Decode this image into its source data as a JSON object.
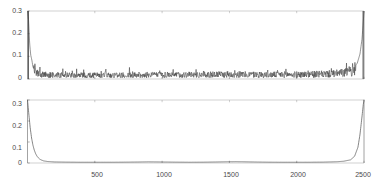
{
  "chart_data": [
    {
      "id": "top-panel",
      "type": "line",
      "title": "",
      "xlabel": "",
      "ylabel": "",
      "xlim": [
        0,
        2500
      ],
      "ylim": [
        0,
        0.3
      ],
      "grid": false,
      "legend": "none",
      "x_tick_labels": [],
      "x_ticks": [
        500,
        1000,
        1500,
        2000,
        2500
      ],
      "y_ticks": [
        0,
        0.1,
        0.2,
        0.3
      ],
      "y_tick_labels": [
        "0",
        "0.1",
        "0.2",
        "0.3"
      ],
      "description": "Noisy signal: tall narrow spike to 0.3 at left edge, dense low-amplitude noise floor around 0.01-0.04 across the middle, tall narrow spike to 0.3 at right edge",
      "series": [
        {
          "name": "noisy",
          "color": "#3c3c3c",
          "x": [
            0,
            8,
            16,
            24,
            32,
            40,
            48,
            56,
            64,
            72,
            80,
            100,
            150,
            200,
            300,
            400,
            500,
            600,
            700,
            800,
            900,
            1000,
            1100,
            1200,
            1250,
            1300,
            1400,
            1500,
            1600,
            1700,
            1800,
            1900,
            2000,
            2100,
            2200,
            2300,
            2380,
            2420,
            2450,
            2470,
            2485,
            2495,
            2500
          ],
          "values": [
            0.3,
            0.26,
            0.155,
            0.105,
            0.085,
            0.055,
            0.042,
            0.035,
            0.03,
            0.026,
            0.024,
            0.022,
            0.02,
            0.019,
            0.018,
            0.018,
            0.018,
            0.019,
            0.018,
            0.019,
            0.02,
            0.019,
            0.02,
            0.021,
            0.02,
            0.02,
            0.021,
            0.022,
            0.021,
            0.021,
            0.02,
            0.021,
            0.021,
            0.022,
            0.023,
            0.026,
            0.032,
            0.045,
            0.07,
            0.11,
            0.175,
            0.255,
            0.3
          ]
        }
      ]
    },
    {
      "id": "bottom-panel",
      "type": "line",
      "title": "",
      "xlabel": "",
      "ylabel": "",
      "xlim": [
        0,
        2500
      ],
      "ylim": [
        0,
        0.3
      ],
      "grid": false,
      "legend": "none",
      "x_ticks": [
        500,
        1000,
        1500,
        2000,
        2500
      ],
      "x_tick_labels": [
        "500",
        "1000",
        "1500",
        "2000",
        "2500"
      ],
      "y_ticks": [
        0,
        0.1,
        0.2,
        0.3
      ],
      "y_tick_labels": [
        "0",
        "0.1",
        "0.2",
        "0.3"
      ],
      "description": "Smooth bathtub curve: starts at 0.3 at x=0, decays steeply to near 0 by x~120, stays near 0.004 across the middle with faint broad bumps near 900 and 1550, rises steeply after x~2400 back to 0.3 at x=2500",
      "series": [
        {
          "name": "smooth",
          "color": "#5a5a5a",
          "x": [
            0,
            10,
            20,
            30,
            40,
            50,
            60,
            70,
            80,
            90,
            100,
            120,
            150,
            200,
            300,
            400,
            500,
            600,
            700,
            800,
            900,
            1000,
            1100,
            1200,
            1300,
            1400,
            1500,
            1550,
            1600,
            1700,
            1800,
            1900,
            2000,
            2100,
            2200,
            2300,
            2350,
            2400,
            2430,
            2455,
            2470,
            2485,
            2495,
            2500
          ],
          "values": [
            0.3,
            0.232,
            0.168,
            0.12,
            0.086,
            0.062,
            0.045,
            0.033,
            0.025,
            0.019,
            0.015,
            0.01,
            0.007,
            0.005,
            0.004,
            0.0035,
            0.0035,
            0.0035,
            0.0038,
            0.0045,
            0.0055,
            0.0048,
            0.004,
            0.0036,
            0.0038,
            0.0048,
            0.006,
            0.0062,
            0.0058,
            0.0046,
            0.0038,
            0.0035,
            0.0034,
            0.0036,
            0.0042,
            0.006,
            0.0085,
            0.015,
            0.032,
            0.075,
            0.135,
            0.22,
            0.28,
            0.3
          ]
        }
      ]
    }
  ],
  "axes": {
    "y_labels": [
      "0.3",
      "0.2",
      "0.1",
      "0"
    ],
    "x_labels": [
      "500",
      "1000",
      "1500",
      "2000",
      "2500"
    ]
  },
  "colors": {
    "axis": "#8c8c8c",
    "trace_top": "#3c3c3c",
    "trace_bottom": "#5a5a5a",
    "text": "#4a4a4a",
    "background": "#ffffff"
  }
}
